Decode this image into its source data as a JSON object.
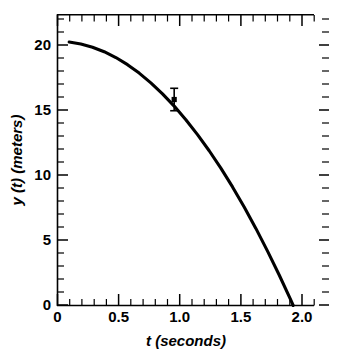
{
  "chart_data": {
    "type": "line",
    "title": "",
    "xlabel": "t (seconds)",
    "ylabel": "y (t)  (meters)",
    "xlim": [
      0,
      2.2
    ],
    "ylim": [
      0,
      22
    ],
    "grid": false,
    "legend": null,
    "x_ticks": [
      {
        "value": 0,
        "label": "0"
      },
      {
        "value": 0.5,
        "label": "0.5"
      },
      {
        "value": 1.0,
        "label": "1.0"
      },
      {
        "value": 1.5,
        "label": "1.5"
      },
      {
        "value": 2.0,
        "label": "2.0"
      }
    ],
    "x_minor_step": 0.1,
    "y_ticks": [
      {
        "value": 0,
        "label": "0"
      },
      {
        "value": 5,
        "label": "5"
      },
      {
        "value": 10,
        "label": "10"
      },
      {
        "value": 15,
        "label": "15"
      },
      {
        "value": 20,
        "label": "20"
      }
    ],
    "y_minor_step": 1,
    "series": [
      {
        "name": "y(t) = 20 - 4.9 t^2",
        "kind": "line",
        "x": [
          0.1,
          0.2,
          0.3,
          0.4,
          0.5,
          0.6,
          0.7,
          0.8,
          0.9,
          1.0,
          1.1,
          1.2,
          1.3,
          1.4,
          1.5,
          1.6,
          1.7,
          1.8,
          1.9,
          2.0,
          2.02
        ],
        "values": [
          19.95,
          19.8,
          19.56,
          19.22,
          18.78,
          18.24,
          17.6,
          16.86,
          16.03,
          15.1,
          14.07,
          12.94,
          11.72,
          10.4,
          8.98,
          7.46,
          5.84,
          4.12,
          2.31,
          0.4,
          0.0
        ]
      },
      {
        "name": "measured point",
        "kind": "scatter-errorbar",
        "x": [
          1.0
        ],
        "values": [
          15.6
        ],
        "yerr": [
          0.85
        ]
      }
    ]
  },
  "axes": {
    "x_axis_name": "t-axis",
    "y_axis_name": "y-axis",
    "top_axis_name": "top-axis",
    "right_axis_name": "right-axis"
  }
}
